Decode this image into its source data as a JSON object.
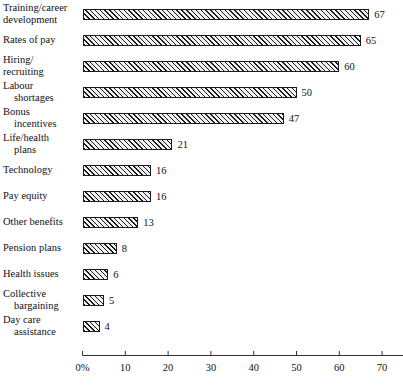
{
  "chart_data": {
    "type": "bar",
    "orientation": "horizontal",
    "title": "",
    "subtitle": "",
    "xlabel": "",
    "ylabel": "",
    "xlim": [
      0,
      75
    ],
    "xticks": [
      0,
      10,
      20,
      30,
      40,
      50,
      60,
      70
    ],
    "xtick_labels": [
      "0%",
      "10",
      "20",
      "30",
      "40",
      "50",
      "60",
      "70"
    ],
    "grid": false,
    "legend": null,
    "bar_style": {
      "fill": "diagonal-hatch",
      "hatch_color": "#1a1a1a",
      "background_color": "#f2f2f2",
      "border_color": "#1a1a1a"
    },
    "categories": [
      "Training/career development",
      "Rates of pay",
      "Hiring/ recruiting",
      "Labour shortages",
      "Bonus incentives",
      "Life/health plans",
      "Technology",
      "Pay equity",
      "Other benefits",
      "Pension plans",
      "Health issues",
      "Collective bargaining",
      "Day care assistance"
    ],
    "values": [
      67,
      65,
      60,
      50,
      47,
      21,
      16,
      16,
      13,
      8,
      6,
      5,
      4
    ],
    "data_labels": [
      "67",
      "65",
      "60",
      "50",
      "47",
      "21",
      "16",
      "16",
      "13",
      "8",
      "6",
      "5",
      "4"
    ]
  },
  "axis": {
    "ticks": [
      {
        "label": "0%",
        "value": 0
      },
      {
        "label": "10",
        "value": 10
      },
      {
        "label": "20",
        "value": 20
      },
      {
        "label": "30",
        "value": 30
      },
      {
        "label": "40",
        "value": 40
      },
      {
        "label": "50",
        "value": 50
      },
      {
        "label": "60",
        "value": 60
      },
      {
        "label": "70",
        "value": 70
      }
    ]
  },
  "rows": [
    {
      "line1": "Training/career",
      "line2": "development",
      "indent2": false,
      "value": 67,
      "value_label": "67"
    },
    {
      "line1": "Rates of pay",
      "line2": "",
      "indent2": false,
      "value": 65,
      "value_label": "65"
    },
    {
      "line1": "Hiring/",
      "line2": "recruiting",
      "indent2": false,
      "value": 60,
      "value_label": "60"
    },
    {
      "line1": "Labour",
      "line2": "shortages",
      "indent2": true,
      "value": 50,
      "value_label": "50"
    },
    {
      "line1": "Bonus",
      "line2": "incentives",
      "indent2": true,
      "value": 47,
      "value_label": "47"
    },
    {
      "line1": "Life/health",
      "line2": "plans",
      "indent2": true,
      "value": 21,
      "value_label": "21"
    },
    {
      "line1": "Technology",
      "line2": "",
      "indent2": false,
      "value": 16,
      "value_label": "16"
    },
    {
      "line1": "Pay equity",
      "line2": "",
      "indent2": false,
      "value": 16,
      "value_label": "16"
    },
    {
      "line1": "Other benefits",
      "line2": "",
      "indent2": false,
      "value": 13,
      "value_label": "13"
    },
    {
      "line1": "Pension plans",
      "line2": "",
      "indent2": false,
      "value": 8,
      "value_label": "8"
    },
    {
      "line1": "Health issues",
      "line2": "",
      "indent2": false,
      "value": 6,
      "value_label": "6"
    },
    {
      "line1": "Collective",
      "line2": "bargaining",
      "indent2": true,
      "value": 5,
      "value_label": "5"
    },
    {
      "line1": "Day care",
      "line2": "assistance",
      "indent2": true,
      "value": 4,
      "value_label": "4"
    }
  ],
  "colors": {
    "background": "#ffffff",
    "ink": "#111111",
    "bar_border": "#1a1a1a",
    "bar_fill": "#f2f2f2",
    "axis": "#333333"
  }
}
